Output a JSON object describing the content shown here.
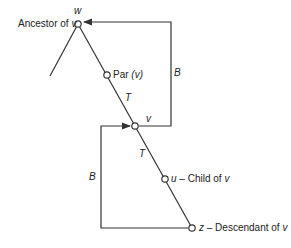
{
  "diagram": {
    "nodes": {
      "w": {
        "name": "w",
        "label": "Ancestor of",
        "var": "v"
      },
      "par": {
        "label": "Par",
        "arg": "(v)"
      },
      "v": {
        "name": "v"
      },
      "u": {
        "name": "u",
        "label": "– Child of",
        "var": "v"
      },
      "z": {
        "name": "z",
        "label": "– Descendant of",
        "var": "v"
      }
    },
    "edge_labels": {
      "tree_upper": "T",
      "tree_lower": "T",
      "back_right": "B",
      "back_left": "B"
    },
    "colors": {
      "line": "#333333",
      "node_fill": "#ffffff"
    }
  }
}
